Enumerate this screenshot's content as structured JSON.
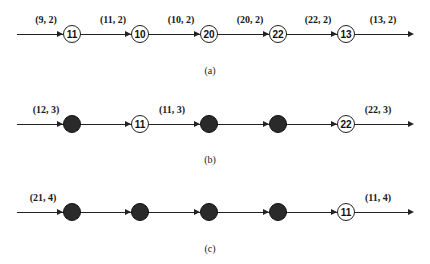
{
  "rows": [
    {
      "id": "a",
      "caption": "(a)",
      "input_label": "(9, 2)",
      "nodes": [
        {
          "type": "open",
          "label": "11",
          "out_label": "(11, 2)"
        },
        {
          "type": "open",
          "label": "10",
          "out_label": "(10, 2)"
        },
        {
          "type": "open",
          "label": "20",
          "out_label": "(20, 2)"
        },
        {
          "type": "open",
          "label": "22",
          "out_label": "(22, 2)"
        },
        {
          "type": "open",
          "label": "13",
          "out_label": "(13, 2)"
        }
      ]
    },
    {
      "id": "b",
      "caption": "(b)",
      "input_label": "(12, 3)",
      "nodes": [
        {
          "type": "filled",
          "label": "",
          "out_label": ""
        },
        {
          "type": "open",
          "label": "11",
          "out_label": "(11, 3)"
        },
        {
          "type": "filled",
          "label": "",
          "out_label": ""
        },
        {
          "type": "filled",
          "label": "",
          "out_label": ""
        },
        {
          "type": "open",
          "label": "22",
          "out_label": "(22, 3)"
        }
      ]
    },
    {
      "id": "c",
      "caption": "(c)",
      "input_label": "(21, 4)",
      "nodes": [
        {
          "type": "filled",
          "label": "",
          "out_label": ""
        },
        {
          "type": "filled",
          "label": "",
          "out_label": ""
        },
        {
          "type": "filled",
          "label": "",
          "out_label": ""
        },
        {
          "type": "filled",
          "label": "",
          "out_label": ""
        },
        {
          "type": "open",
          "label": "11",
          "out_label": "(11, 4)"
        }
      ]
    }
  ]
}
